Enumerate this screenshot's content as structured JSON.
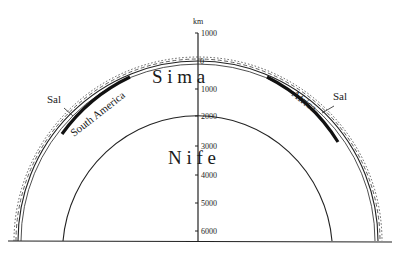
{
  "diagram": {
    "axis_unit": "km",
    "axis_ticks": [
      {
        "label": "1000",
        "y": 33
      },
      {
        "label": "0",
        "y": 62
      },
      {
        "label": "1000",
        "y": 89
      },
      {
        "label": "2000",
        "y": 116
      },
      {
        "label": "3000",
        "y": 146
      },
      {
        "label": "4000",
        "y": 175
      },
      {
        "label": "5000",
        "y": 203
      },
      {
        "label": "6000",
        "y": 231
      }
    ],
    "layers": {
      "mantle_label": "S i m a",
      "core_label": "N i f e"
    },
    "continents": {
      "left": "South America",
      "right": "Africa"
    },
    "sal_left": "Sal",
    "sal_right": "Sal"
  }
}
